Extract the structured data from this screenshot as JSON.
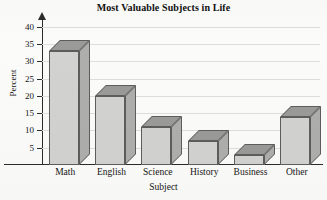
{
  "chart_data": {
    "type": "bar",
    "title": "Most Valuable Subjects in Life",
    "xlabel": "Subject",
    "ylabel": "Percent",
    "categories": [
      "Math",
      "English",
      "Science",
      "History",
      "Business",
      "Other"
    ],
    "values": [
      33,
      20,
      11,
      7,
      3,
      14
    ],
    "ylim": [
      0,
      42
    ],
    "yticks": [
      5,
      10,
      15,
      20,
      25,
      30,
      35,
      40
    ],
    "ytick_labels": [
      "5",
      "10",
      "15",
      "20",
      "25",
      "30",
      "35",
      "40"
    ],
    "grid": true,
    "legend": false,
    "style": {
      "bar_front_color": "#d2d2d0",
      "bar_top_color": "#9a9a98",
      "bar_side_color": "#aeaeac",
      "bar_edge_color": "#5d5d5d",
      "axis_color": "#2b2b2b",
      "grid_color": "#dedede",
      "background_color": "#fbfbf9",
      "text_color": "#151515"
    }
  }
}
